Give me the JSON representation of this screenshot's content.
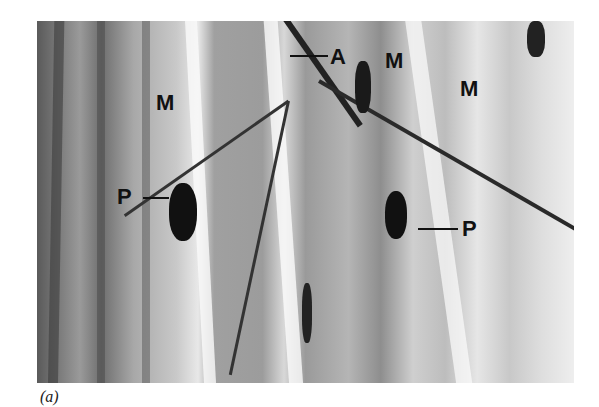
{
  "figure": {
    "caption": "(a)",
    "labels": {
      "axon": "A",
      "muscle_1": "M",
      "muscle_2": "M",
      "muscle_3": "M",
      "plate_left": "P",
      "plate_right": "P"
    }
  }
}
